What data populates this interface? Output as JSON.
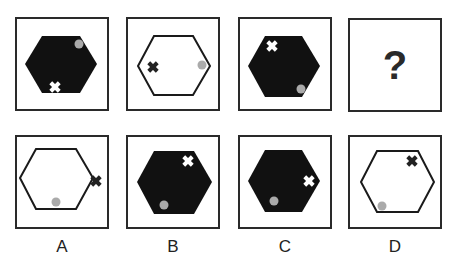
{
  "puzzle": {
    "question_row": [
      {
        "id": "q1",
        "hexagon_fill": "black",
        "dot": {
          "x": 62,
          "y": 25
        },
        "cross": {
          "x": 38,
          "y": 68,
          "color": "white"
        }
      },
      {
        "id": "q2",
        "hexagon_fill": "white",
        "dot": {
          "x": 74,
          "y": 46
        },
        "cross": {
          "x": 25,
          "y": 48,
          "color": "black"
        }
      },
      {
        "id": "q3",
        "hexagon_fill": "black",
        "dot": {
          "x": 61,
          "y": 70
        },
        "cross": {
          "x": 32,
          "y": 27,
          "color": "white"
        }
      },
      {
        "id": "q4",
        "placeholder": "?"
      }
    ],
    "options": [
      {
        "label": "A",
        "hexagon_fill": "white",
        "dot": {
          "x": 39,
          "y": 69
        },
        "cross": {
          "x": 79,
          "y": 44,
          "color": "black"
        }
      },
      {
        "label": "B",
        "hexagon_fill": "black",
        "dot": {
          "x": 36,
          "y": 68
        },
        "cross": {
          "x": 60,
          "y": 24,
          "color": "white"
        }
      },
      {
        "label": "C",
        "hexagon_fill": "black",
        "dot": {
          "x": 34,
          "y": 64
        },
        "cross": {
          "x": 69,
          "y": 44,
          "color": "white"
        }
      },
      {
        "label": "D",
        "hexagon_fill": "white",
        "dot": {
          "x": 32,
          "y": 69
        },
        "cross": {
          "x": 62,
          "y": 24,
          "color": "black"
        }
      }
    ],
    "colors": {
      "border": "#2a2a2a",
      "hex_dark": "#111111",
      "dot": "#aaaaaa"
    }
  }
}
